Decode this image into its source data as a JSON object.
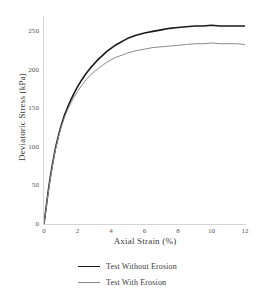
{
  "chart_data": {
    "type": "line",
    "title": "",
    "xlabel": "Axial Strain (%)",
    "ylabel": "Deviatoric Stress (kPa)",
    "xlim": [
      0,
      12
    ],
    "ylim": [
      0,
      270
    ],
    "xticks": [
      0,
      2,
      4,
      6,
      8,
      10,
      12
    ],
    "yticks": [
      0,
      50,
      100,
      150,
      200,
      250
    ],
    "xtick_labels": [
      "0",
      "2",
      "4",
      "6",
      "8",
      "10",
      "12"
    ],
    "ytick_labels": [
      "0",
      "50",
      "100",
      "150",
      "200",
      "250"
    ],
    "grid": false,
    "legend_position": "below",
    "series": [
      {
        "name": "Test Without Erosion",
        "color": "#1a1a1a",
        "width": 1.6,
        "x": [
          0,
          0.05,
          0.1,
          0.2,
          0.3,
          0.4,
          0.5,
          0.6,
          0.7,
          0.8,
          0.9,
          1.0,
          1.2,
          1.4,
          1.6,
          1.8,
          2.0,
          2.25,
          2.5,
          2.75,
          3.0,
          3.25,
          3.5,
          3.75,
          4.0,
          4.25,
          4.5,
          4.75,
          5.0,
          5.5,
          6.0,
          6.5,
          7.0,
          7.5,
          8.0,
          8.5,
          9.0,
          9.5,
          10.0,
          10.5,
          11.0,
          11.5,
          12.0
        ],
        "y": [
          0,
          8,
          17,
          34,
          50,
          64,
          77,
          89,
          100,
          109,
          118,
          126,
          140,
          151,
          161,
          170,
          178,
          187,
          195,
          202,
          208,
          214,
          219,
          224,
          228,
          232,
          235,
          238,
          241,
          245,
          248,
          250,
          252,
          254,
          255,
          256,
          257,
          257,
          258,
          257,
          257,
          257,
          257
        ]
      },
      {
        "name": "Test With Erosion",
        "color": "#8a8a8a",
        "width": 1.0,
        "x": [
          0,
          0.05,
          0.1,
          0.2,
          0.3,
          0.4,
          0.5,
          0.6,
          0.7,
          0.8,
          0.9,
          1.0,
          1.2,
          1.4,
          1.6,
          1.8,
          2.0,
          2.25,
          2.5,
          2.75,
          3.0,
          3.25,
          3.5,
          3.75,
          4.0,
          4.25,
          4.5,
          4.75,
          5.0,
          5.5,
          6.0,
          6.5,
          7.0,
          7.5,
          8.0,
          8.5,
          9.0,
          9.5,
          10.0,
          10.5,
          11.0,
          11.5,
          12.0
        ],
        "y": [
          0,
          8,
          16,
          33,
          48,
          62,
          75,
          87,
          98,
          107,
          116,
          124,
          137,
          148,
          157,
          165,
          172,
          180,
          187,
          193,
          198,
          202,
          206,
          210,
          213,
          216,
          218,
          220,
          222,
          225,
          227,
          229,
          230,
          231,
          232,
          233,
          234,
          234,
          235,
          234,
          234,
          234,
          233
        ]
      }
    ]
  },
  "legend": {
    "items": [
      {
        "label": "Test Without Erosion"
      },
      {
        "label": "Test With Erosion"
      }
    ]
  }
}
